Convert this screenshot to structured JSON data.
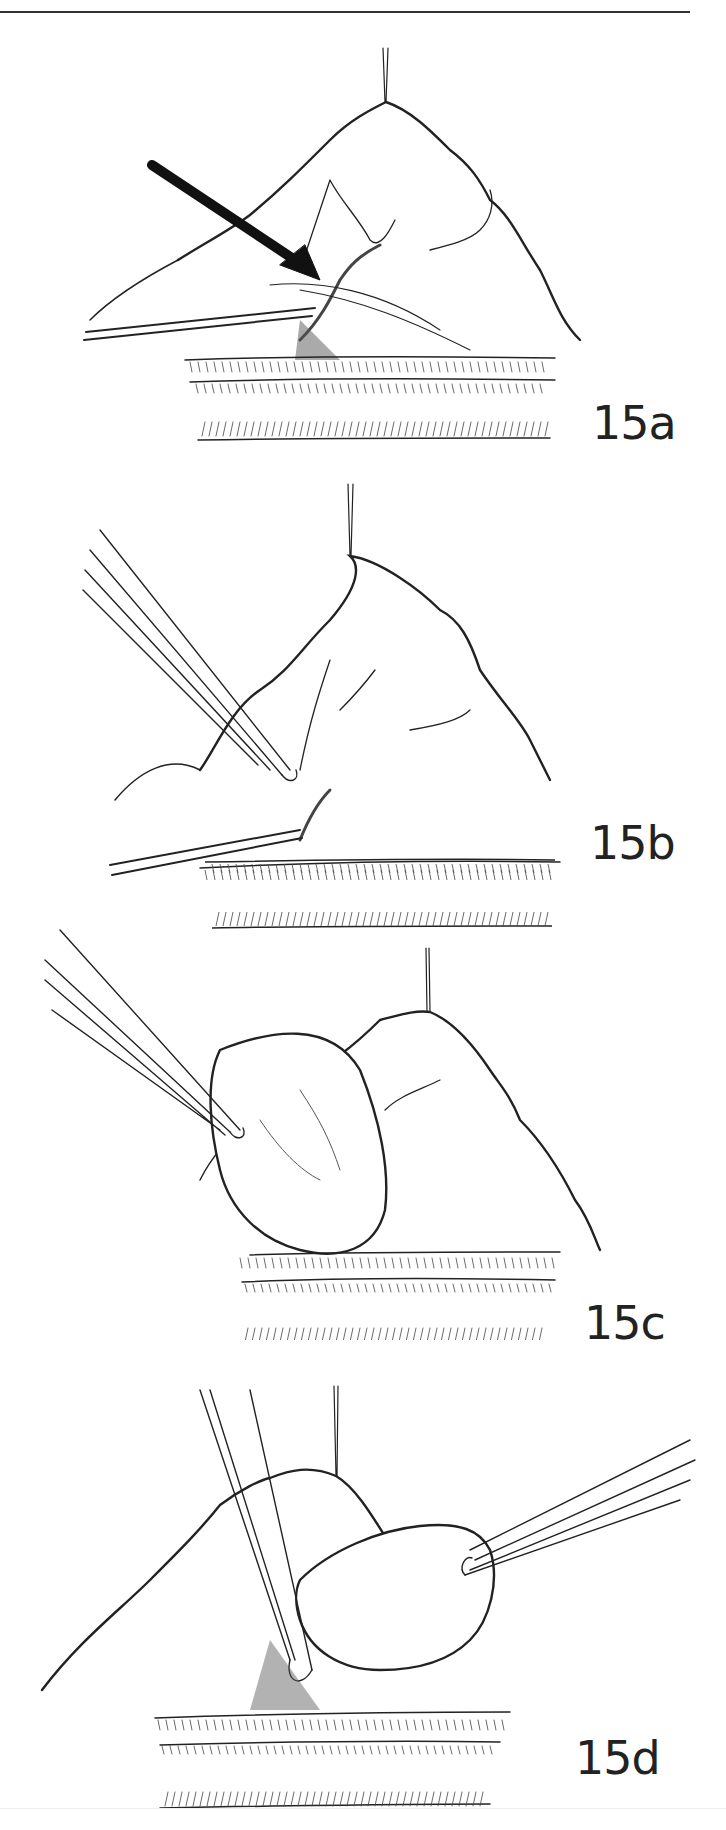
{
  "page": {
    "header_rule": true
  },
  "figures": [
    {
      "id": "15a",
      "label": "15a",
      "description": "Surgical illustration with arrow pointing to vessel junction; suture on apex, retractor instrument from left"
    },
    {
      "id": "15b",
      "label": "15b",
      "description": "Forceps introduced from upper-left grasping tissue at vessel junction"
    },
    {
      "id": "15c",
      "label": "15c",
      "description": "Forceps lifting a rounded tissue mass away from base"
    },
    {
      "id": "15d",
      "label": "15d",
      "description": "Forceps from right holding tissue mass; second instrument from above at base"
    }
  ],
  "colors": {
    "ink": "#222222",
    "paper": "#ffffff"
  }
}
